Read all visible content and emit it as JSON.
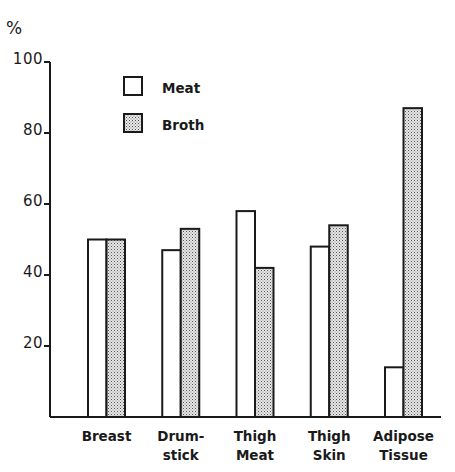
{
  "chart_data": {
    "type": "bar",
    "title": "",
    "xlabel": "",
    "ylabel": "%",
    "ylim": [
      0,
      100
    ],
    "yticks": [
      {
        "value": 100,
        "label": "100"
      },
      {
        "value": 80,
        "label": "80"
      },
      {
        "value": 60,
        "label": "60"
      },
      {
        "value": 40,
        "label": "40"
      },
      {
        "value": 20,
        "label": "20"
      }
    ],
    "categories": [
      [
        "Breast"
      ],
      [
        "Drum-",
        "stick"
      ],
      [
        "Thigh",
        "Meat"
      ],
      [
        "Thigh",
        "Skin"
      ],
      [
        "Adipose",
        "Tissue"
      ]
    ],
    "category_names": [
      "Breast",
      "Drumstick",
      "Thigh Meat",
      "Thigh Skin",
      "Adipose Tissue"
    ],
    "series": [
      {
        "name": "Meat",
        "pattern": "open",
        "values": [
          50,
          47,
          58,
          48,
          14
        ]
      },
      {
        "name": "Broth",
        "pattern": "stippled",
        "values": [
          50,
          53,
          42,
          54,
          87
        ]
      }
    ],
    "legend": {
      "position": "top-left",
      "entries": [
        "Meat",
        "Broth"
      ]
    },
    "grid": false
  }
}
